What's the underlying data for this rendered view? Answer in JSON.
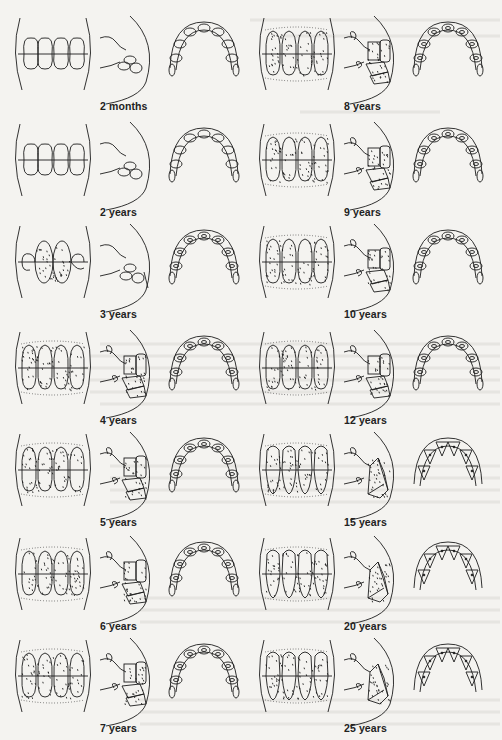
{
  "figure": {
    "views_per_stage": [
      "front view",
      "side view",
      "occlusal view"
    ],
    "columns": [
      {
        "stages": [
          {
            "label": "2 months",
            "style": "plain",
            "dots": false,
            "top": 4
          },
          {
            "label": "2 years",
            "style": "plain",
            "dots": false,
            "top": 110
          },
          {
            "label": "3 years",
            "style": "ovalcenter",
            "dots": true,
            "top": 212
          },
          {
            "label": "4 years",
            "style": "full",
            "dots": true,
            "top": 318
          },
          {
            "label": "5 years",
            "style": "full",
            "dots": true,
            "top": 420
          },
          {
            "label": "6 years",
            "style": "full",
            "dots": true,
            "top": 524
          },
          {
            "label": "7 years",
            "style": "full",
            "dots": true,
            "top": 626
          }
        ]
      },
      {
        "stages": [
          {
            "label": "8 years",
            "style": "full",
            "dots": true,
            "top": 4
          },
          {
            "label": "9 years",
            "style": "full",
            "dots": true,
            "top": 110
          },
          {
            "label": "10 years",
            "style": "full",
            "dots": true,
            "top": 212
          },
          {
            "label": "12 years",
            "style": "full",
            "dots": true,
            "top": 318
          },
          {
            "label": "15 years",
            "style": "worn",
            "dots": true,
            "top": 420
          },
          {
            "label": "20 years",
            "style": "worn",
            "dots": true,
            "top": 524
          },
          {
            "label": "25 years",
            "style": "worn",
            "dots": true,
            "top": 626
          }
        ]
      }
    ]
  },
  "colors": {
    "ink": "#1c1c1c",
    "paper": "#f4f3f0",
    "bleed": "#d9d7d2"
  }
}
